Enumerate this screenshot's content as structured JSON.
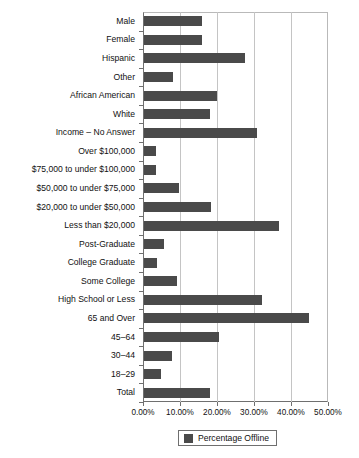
{
  "chart_data": {
    "type": "bar",
    "orientation": "horizontal",
    "title": "",
    "xlabel": "",
    "ylabel": "",
    "xlim": [
      0,
      50
    ],
    "xticks": [
      "0.00%",
      "10.00%",
      "20.00%",
      "30.00%",
      "40.00%",
      "50.00%"
    ],
    "xtick_values": [
      0,
      10,
      20,
      30,
      40,
      50
    ],
    "grid": true,
    "legend": {
      "position": "bottom",
      "entries": [
        {
          "label": "Percentage Offline",
          "color": "#4a4a4a"
        }
      ]
    },
    "series": [
      {
        "name": "Percentage Offline",
        "color": "#4a4a4a",
        "values": [
          15.7,
          15.6,
          27.3,
          7.8,
          19.7,
          17.8,
          30.5,
          3.2,
          3.2,
          9.5,
          18.0,
          36.5,
          5.4,
          3.5,
          8.9,
          31.9,
          44.6,
          20.3,
          7.5,
          4.6,
          17.8
        ]
      }
    ],
    "categories": [
      "Male",
      "Female",
      "Hispanic",
      "Other",
      "African American",
      "White",
      "Income – No Answer",
      "Over $100,000",
      "$75,000 to under $100,000",
      "$50,000 to under $75,000",
      "$20,000 to under $50,000",
      "Less than $20,000",
      "Post-Graduate",
      "College Graduate",
      "Some College",
      "High School or Less",
      "65 and Over",
      "45–64",
      "30–44",
      "18–29",
      "Total"
    ]
  }
}
